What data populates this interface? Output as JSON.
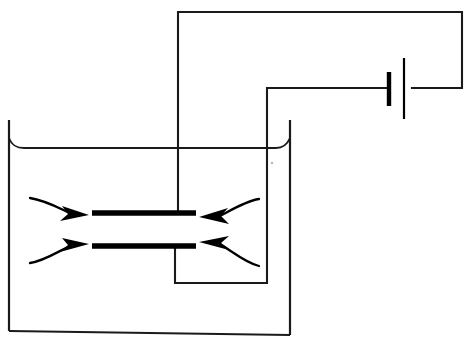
{
  "figure": {
    "background_color": "#ffffff",
    "ink_color": "#1a1a1a",
    "width": 470,
    "height": 346
  },
  "beaker": {
    "name": "beaker-container",
    "left_wall_x": 9,
    "right_wall_x": 290,
    "rim_y": 120,
    "bottom_y": 335,
    "bottom_left_x": 15,
    "bottom_right_x": 285,
    "stroke_width": 2.2
  },
  "liquid": {
    "name": "liquid-surface-line",
    "surface_y": 148,
    "meniscus_left_x": 9,
    "meniscus_right_x": 290,
    "meniscus_depth": 10,
    "stroke_width": 1.9
  },
  "electrodes": {
    "top_plate": {
      "name": "top-electrode-plate",
      "x1": 92,
      "x2": 196,
      "y": 213,
      "thickness": 5.4
    },
    "bottom_plate": {
      "name": "bottom-electrode-plate",
      "x1": 92,
      "x2": 196,
      "y": 246,
      "thickness": 5.4
    },
    "gap": 33
  },
  "circuit": {
    "top_lead": {
      "name": "top-plate-lead-wire",
      "path": "M 178 213 L 178 12 L 462 12 L 462 88 L 412 88"
    },
    "bottom_lead": {
      "name": "bottom-plate-lead-wire",
      "path": "M 175 246 L 175 283 L 267 283 L 267 88 L 389 88"
    },
    "battery": {
      "name": "battery-symbol",
      "negative_bar": {
        "x": 389,
        "y1": 72,
        "y2": 106,
        "width": 4.4
      },
      "positive_bar": {
        "x": 404,
        "y1": 58,
        "y2": 119,
        "width": 2.2
      },
      "lead_left_x": 267,
      "lead_right_x": 462,
      "lead_y": 88
    }
  },
  "flow_arrows": {
    "label": "dielectric liquid drawn inward between plates",
    "count": 4,
    "stroke_width": 2.3,
    "items": [
      {
        "name": "flow-arrow-upper-left",
        "direction": "right",
        "stem": "M 31 199 C 45 200, 58 208, 72 214",
        "tip_x": 88,
        "tip_y": 215
      },
      {
        "name": "flow-arrow-lower-left",
        "direction": "right",
        "stem": "M 31 262 C 45 261, 58 252, 72 245",
        "tip_x": 88,
        "tip_y": 244
      },
      {
        "name": "flow-arrow-upper-right",
        "direction": "left",
        "stem": "M 258 200 C 245 201, 232 210, 218 216",
        "tip_x": 200,
        "tip_y": 217
      },
      {
        "name": "flow-arrow-lower-right",
        "direction": "left",
        "stem": "M 258 264 C 245 262, 232 252, 218 245",
        "tip_x": 200,
        "tip_y": 243
      }
    ]
  },
  "artifacts": {
    "speck": {
      "name": "scan-speck",
      "x": 272,
      "y": 163,
      "r": 1.4
    }
  }
}
